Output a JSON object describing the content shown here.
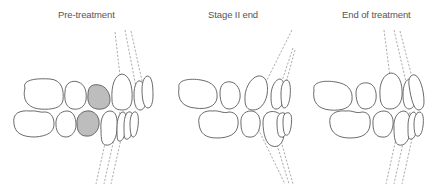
{
  "figure": {
    "panels": [
      {
        "id": "pre-treatment",
        "title": "Pre-treatment",
        "highlighted_teeth": [
          "upper-premolar-2",
          "lower-premolar-2"
        ]
      },
      {
        "id": "stage-ii-end",
        "title": "Stage II end",
        "highlighted_teeth": []
      },
      {
        "id": "end-of-treatment",
        "title": "End of treatment",
        "highlighted_teeth": []
      }
    ],
    "colors": {
      "outline": "#5a5a5a",
      "highlight_fill": "#bdbdbd",
      "axis_lines": "#8a8a8a",
      "title_text": "#555555",
      "background": "#ffffff"
    }
  }
}
